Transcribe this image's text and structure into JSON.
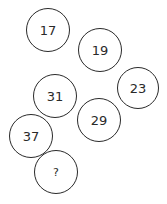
{
  "puzzle": {
    "type": "number-sequence",
    "circles": [
      {
        "label": "17",
        "cx": 48,
        "cy": 30,
        "r": 22
      },
      {
        "label": "19",
        "cx": 100,
        "cy": 50,
        "r": 22
      },
      {
        "label": "23",
        "cx": 138,
        "cy": 88,
        "r": 21
      },
      {
        "label": "31",
        "cx": 55,
        "cy": 96,
        "r": 22
      },
      {
        "label": "29",
        "cx": 99,
        "cy": 120,
        "r": 22
      },
      {
        "label": "37",
        "cx": 31,
        "cy": 136,
        "r": 22
      },
      {
        "label": "?",
        "cx": 56,
        "cy": 172,
        "r": 22
      }
    ]
  }
}
